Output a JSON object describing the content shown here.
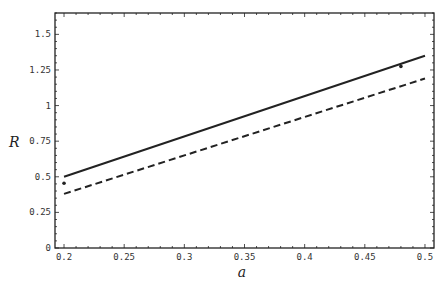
{
  "chart_data": {
    "type": "line",
    "title": "",
    "xlabel": "a",
    "ylabel": "R",
    "xlim": [
      0.1925,
      0.5075
    ],
    "ylim": [
      0,
      1.65
    ],
    "xticks": [
      0.2,
      0.25,
      0.3,
      0.35,
      0.4,
      0.45,
      0.5
    ],
    "xtick_labels": [
      "0.2",
      "0.25",
      "0.3",
      "0.35",
      "0.4",
      "0.45",
      "0.5"
    ],
    "yticks": [
      0,
      0.25,
      0.5,
      0.75,
      1,
      1.25,
      1.5
    ],
    "ytick_labels": [
      "0",
      "0.25",
      "0.5",
      "0.75",
      "1",
      "1.25",
      "1.5"
    ],
    "grid": false,
    "legend": null,
    "series": [
      {
        "name": "solid",
        "style": "solid",
        "x": [
          0.2,
          0.5
        ],
        "y": [
          0.5,
          1.35
        ]
      },
      {
        "name": "dashed",
        "style": "dashed",
        "x": [
          0.2,
          0.5
        ],
        "y": [
          0.38,
          1.19
        ]
      },
      {
        "name": "points",
        "style": "marker",
        "x": [
          0.2,
          0.48
        ],
        "y": [
          0.455,
          1.275
        ]
      }
    ]
  }
}
